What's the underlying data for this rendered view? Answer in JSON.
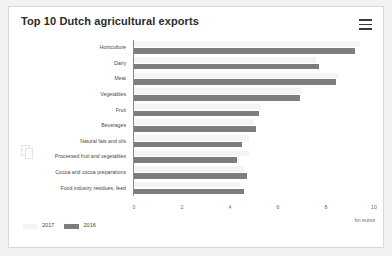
{
  "panel": {
    "title": "Top 10 Dutch agricultural exports",
    "menu_icon": "hamburger-menu-icon",
    "watermark": "cbs-logo-watermark"
  },
  "chart_data": {
    "type": "bar",
    "orientation": "horizontal",
    "title": "Top 10 Dutch agricultural exports",
    "xlabel": "bn euros",
    "ylabel": "",
    "xlim": [
      0,
      10
    ],
    "xticks": [
      0,
      2,
      4,
      6,
      8,
      10
    ],
    "grid": false,
    "legend_position": "bottom-left",
    "categories": [
      "Horticulture",
      "Dairy",
      "Meat",
      "Vegetables",
      "Fruit",
      "Beverages",
      "Natural fats and oils",
      "Processed fruit and vegetables",
      "Cocoa and cocoa preparations",
      "Food industry residues, feed"
    ],
    "series": [
      {
        "name": "2017",
        "color": "#f4f4f4",
        "values": [
          9.4,
          7.6,
          8.5,
          7.0,
          5.3,
          5.0,
          4.8,
          4.8,
          4.6,
          4.4
        ]
      },
      {
        "name": "2016",
        "color": "#7d7d7d",
        "values": [
          9.2,
          7.7,
          8.4,
          6.9,
          5.2,
          5.1,
          4.5,
          4.3,
          4.7,
          4.6
        ]
      }
    ]
  }
}
